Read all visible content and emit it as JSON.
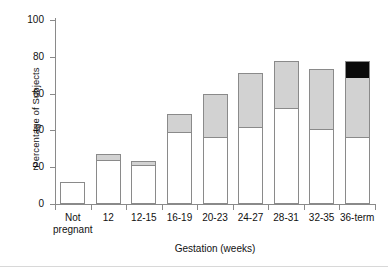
{
  "chart_data": {
    "type": "bar",
    "stacked": true,
    "title": "",
    "xlabel": "Gestation (weeks)",
    "ylabel": "Percentage of Subjects",
    "ylim": [
      0,
      100
    ],
    "yticks": [
      0,
      20,
      40,
      60,
      80,
      100
    ],
    "ytick_labels": [
      "0",
      "20",
      "40",
      "60",
      "80",
      "100"
    ],
    "grid": false,
    "legend": "none",
    "categories": [
      "Not pregnant",
      "12",
      "12-15",
      "16-19",
      "20-23",
      "24-27",
      "28-31",
      "32-35",
      "36-term"
    ],
    "category_lines": [
      [
        "Not",
        "pregnant"
      ],
      [
        "12",
        ""
      ],
      [
        "12-15",
        ""
      ],
      [
        "16-19",
        ""
      ],
      [
        "20-23",
        ""
      ],
      [
        "24-27",
        ""
      ],
      [
        "28-31",
        ""
      ],
      [
        "32-35",
        ""
      ],
      [
        "36-term",
        ""
      ]
    ],
    "series": [
      {
        "name": "white-segment",
        "color": "#ffffff",
        "values": [
          12,
          24,
          21,
          39,
          36.5,
          42,
          52,
          41,
          36.5
        ]
      },
      {
        "name": "gray-segment",
        "color": "#d2d2d2",
        "values": [
          0,
          3,
          2.5,
          10,
          23.5,
          29,
          25.5,
          32.5,
          32.5
        ]
      },
      {
        "name": "black-segment",
        "color": "#0b0b0b",
        "values": [
          0,
          0,
          0,
          0,
          0,
          0,
          0,
          0,
          8.5
        ]
      }
    ],
    "totals": [
      12,
      27,
      23.5,
      49,
      60,
      71,
      77.5,
      73.5,
      77.5
    ]
  },
  "colors": {
    "axis": "#8a8a8a",
    "text": "#111111",
    "white_segment": "#ffffff",
    "gray_segment": "#d2d2d2",
    "black_segment": "#0b0b0b",
    "background": "#ffffff"
  }
}
